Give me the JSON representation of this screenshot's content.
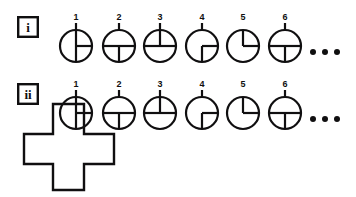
{
  "figure": {
    "background_color": "#ffffff",
    "ink_color": "#100f10",
    "rows": [
      {
        "id": "row-i",
        "label": "i",
        "label_shape": "square-box",
        "label_box": {
          "x": 17,
          "y": 16,
          "w": 22,
          "h": 22
        },
        "ellipsis": "• • •",
        "circles": [
          {
            "number": "1",
            "cx": 76,
            "cy": 46,
            "r": 16,
            "radii_degrees": [
              90,
              0,
              270
            ],
            "stem": true
          },
          {
            "number": "2",
            "cx": 119,
            "cy": 46,
            "r": 16,
            "radii_degrees": [
              180,
              0,
              270
            ],
            "stem": true
          },
          {
            "number": "3",
            "cx": 160,
            "cy": 46,
            "r": 16,
            "radii_degrees": [
              90,
              180,
              0
            ],
            "stem": true
          },
          {
            "number": "4",
            "cx": 202,
            "cy": 46,
            "r": 16,
            "radii_degrees": [
              0,
              270
            ],
            "stem": true
          },
          {
            "number": "5",
            "cx": 243,
            "cy": 46,
            "r": 16,
            "radii_degrees": [
              90,
              0
            ],
            "stem": false
          },
          {
            "number": "6",
            "cx": 285,
            "cy": 46,
            "r": 16,
            "radii_degrees": [
              180,
              0,
              270
            ],
            "stem": true
          }
        ],
        "dots": [
          {
            "cx": 313,
            "cy": 52,
            "r": 3
          },
          {
            "cx": 325,
            "cy": 52,
            "r": 3
          },
          {
            "cx": 337,
            "cy": 52,
            "r": 3
          }
        ]
      },
      {
        "id": "row-ii",
        "label": "ii",
        "label_shape": "square-box",
        "label_box": {
          "x": 17,
          "y": 83,
          "w": 22,
          "h": 22
        },
        "ellipsis": "• • •",
        "circles": [
          {
            "number": "1",
            "cx": 76,
            "cy": 113,
            "r": 16,
            "radii_degrees": [
              90,
              0,
              270
            ],
            "stem": true
          },
          {
            "number": "2",
            "cx": 119,
            "cy": 113,
            "r": 16,
            "radii_degrees": [
              180,
              0,
              270
            ],
            "stem": true
          },
          {
            "number": "3",
            "cx": 160,
            "cy": 113,
            "r": 16,
            "radii_degrees": [
              90,
              180,
              0
            ],
            "stem": true
          },
          {
            "number": "4",
            "cx": 202,
            "cy": 113,
            "r": 16,
            "radii_degrees": [
              0,
              270
            ],
            "stem": true
          },
          {
            "number": "5",
            "cx": 243,
            "cy": 113,
            "r": 16,
            "radii_degrees": [
              90,
              0
            ],
            "stem": false
          },
          {
            "number": "6",
            "cx": 285,
            "cy": 113,
            "r": 16,
            "radii_degrees": [
              180,
              0,
              270
            ],
            "stem": true
          }
        ],
        "dots": [
          {
            "cx": 313,
            "cy": 119,
            "r": 3
          },
          {
            "cx": 325,
            "cy": 119,
            "r": 3
          },
          {
            "cx": 337,
            "cy": 119,
            "r": 3
          }
        ],
        "cross": {
          "name": "plus-polygon",
          "points": "53,104 84,104 84,134 114,134 114,164 84,164 84,190 53,190 53,164 24,164 24,134 53,134"
        }
      }
    ],
    "strokes": {
      "circle_width": 2.2,
      "radius_width": 2.2,
      "box_width": 2.4,
      "cross_width": 2.4
    },
    "fonts": {
      "number_size": 9,
      "label_size": 13
    }
  }
}
